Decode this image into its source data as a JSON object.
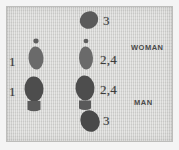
{
  "figure": {
    "kind": "footprint-step-diagram",
    "width": 179,
    "height": 150,
    "background_color": "#f4f4f4",
    "plate_color": "#d8d8d6",
    "ink_color": "#5a5a5a",
    "ink_dark_color": "#4a4a4a",
    "text_color": "#3a3a3a"
  },
  "roles": [
    {
      "id": "woman",
      "label": "WOMAN",
      "x": 131,
      "y": 44
    },
    {
      "id": "man",
      "label": "MAN",
      "x": 134,
      "y": 99
    }
  ],
  "step_labels": [
    {
      "id": "left-step-1-upper",
      "text": "1",
      "x": 9,
      "y": 55,
      "column": "left",
      "size": 13
    },
    {
      "id": "left-step-1-lower",
      "text": "1",
      "x": 9,
      "y": 85,
      "column": "left",
      "size": 13
    },
    {
      "id": "right-step-3-top",
      "text": "3",
      "x": 103,
      "y": 14,
      "column": "right",
      "size": 13
    },
    {
      "id": "right-step-2-4-upper",
      "text": "2,4",
      "x": 100,
      "y": 53,
      "column": "right",
      "size": 13
    },
    {
      "id": "right-step-2-4-lower",
      "text": "2,4",
      "x": 100,
      "y": 83,
      "column": "right",
      "size": 13
    },
    {
      "id": "right-step-3-bottom",
      "text": "3",
      "x": 103,
      "y": 114,
      "column": "right",
      "size": 13
    }
  ],
  "footprints": [
    {
      "id": "woman-left-foot-ball",
      "group": "left-column",
      "role": "woman",
      "part": "ball-of-foot",
      "shape": "ellipse",
      "cx": 36,
      "cy": 58,
      "rx": 7.5,
      "ry": 11.5,
      "rotate": -4,
      "fill": "#6b6b6b"
    },
    {
      "id": "woman-left-foot-heel-dot",
      "group": "left-column",
      "role": "woman",
      "part": "heel-dot",
      "shape": "ellipse",
      "cx": 36,
      "cy": 41,
      "rx": 2.6,
      "ry": 2.4,
      "rotate": 0,
      "fill": "#5f5f5f"
    },
    {
      "id": "man-left-foot-sole",
      "group": "left-column",
      "role": "man",
      "part": "sole",
      "shape": "ellipse",
      "cx": 34,
      "cy": 89,
      "rx": 9.5,
      "ry": 12.5,
      "rotate": -3,
      "fill": "#4d4d4d"
    },
    {
      "id": "man-left-foot-heel",
      "group": "left-column",
      "role": "man",
      "part": "heel",
      "shape": "heel",
      "cx": 34,
      "cy": 107,
      "rx": 6.5,
      "ry": 6.0,
      "rotate": 0,
      "fill": "#5a5a5a"
    },
    {
      "id": "woman-right-foot-top-sole",
      "group": "right-column",
      "role": "woman",
      "part": "sole",
      "shape": "ellipse",
      "cx": 89,
      "cy": 20,
      "rx": 9.5,
      "ry": 8.5,
      "rotate": -32,
      "fill": "#5a5a5a"
    },
    {
      "id": "woman-right-foot-ball",
      "group": "right-column",
      "role": "woman",
      "part": "ball-of-foot",
      "shape": "ellipse",
      "cx": 86,
      "cy": 58,
      "rx": 7.0,
      "ry": 11.5,
      "rotate": -3,
      "fill": "#6b6b6b"
    },
    {
      "id": "woman-right-foot-heel-dot",
      "group": "right-column",
      "role": "woman",
      "part": "heel-dot",
      "shape": "ellipse",
      "cx": 86,
      "cy": 41,
      "rx": 2.4,
      "ry": 2.2,
      "rotate": 0,
      "fill": "#5f5f5f"
    },
    {
      "id": "man-right-foot-sole",
      "group": "right-column",
      "role": "man",
      "part": "sole",
      "shape": "ellipse",
      "cx": 85,
      "cy": 88,
      "rx": 9.5,
      "ry": 12.5,
      "rotate": -4,
      "fill": "#4d4d4d"
    },
    {
      "id": "man-right-foot-heel",
      "group": "right-column",
      "role": "man",
      "part": "heel",
      "shape": "heel",
      "cx": 85,
      "cy": 106,
      "rx": 6.0,
      "ry": 5.5,
      "rotate": 0,
      "fill": "#5a5a5a"
    },
    {
      "id": "man-right-foot-bottom-sole",
      "group": "right-column",
      "role": "man",
      "part": "sole",
      "shape": "ellipse",
      "cx": 90,
      "cy": 121,
      "rx": 9.5,
      "ry": 11.0,
      "rotate": -22,
      "fill": "#4a4a4a"
    }
  ]
}
